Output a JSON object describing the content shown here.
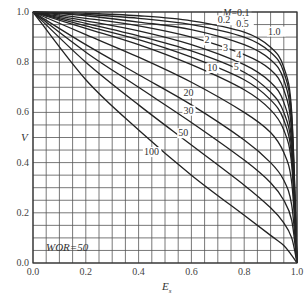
{
  "chart_data": {
    "type": "line",
    "title": "",
    "xlabel": "E_s",
    "ylabel": "V",
    "xlim": [
      0.0,
      1.0
    ],
    "ylim": [
      0.0,
      1.0
    ],
    "grid": true,
    "grid_step": 0.05,
    "x_ticks": [
      "0.0",
      "0.2",
      "0.4",
      "0.6",
      "0.8",
      "1.0"
    ],
    "y_ticks": [
      "0.0",
      "0.2",
      "0.4",
      "0.6",
      "0.8",
      "1.0"
    ],
    "annotation": "WOR=50",
    "legend": "curve labels inline, M = mobility ratio",
    "series": [
      {
        "name": "M=0.1",
        "label": "M=0.1",
        "points": [
          [
            0,
            1
          ],
          [
            0.2,
            0.995
          ],
          [
            0.4,
            0.985
          ],
          [
            0.6,
            0.965
          ],
          [
            0.8,
            0.92
          ],
          [
            0.9,
            0.86
          ],
          [
            0.95,
            0.78
          ],
          [
            0.98,
            0.6
          ],
          [
            1.0,
            0
          ]
        ]
      },
      {
        "name": "0.2",
        "label": "0.2",
        "points": [
          [
            0,
            1
          ],
          [
            0.2,
            0.99
          ],
          [
            0.4,
            0.975
          ],
          [
            0.6,
            0.95
          ],
          [
            0.8,
            0.9
          ],
          [
            0.9,
            0.84
          ],
          [
            0.95,
            0.76
          ],
          [
            0.98,
            0.58
          ],
          [
            1.0,
            0
          ]
        ]
      },
      {
        "name": "0.5",
        "label": "0.5",
        "points": [
          [
            0,
            1
          ],
          [
            0.2,
            0.985
          ],
          [
            0.4,
            0.96
          ],
          [
            0.6,
            0.93
          ],
          [
            0.8,
            0.87
          ],
          [
            0.9,
            0.81
          ],
          [
            0.95,
            0.73
          ],
          [
            0.98,
            0.55
          ],
          [
            1.0,
            0
          ]
        ]
      },
      {
        "name": "1.0",
        "label": "1.0",
        "points": [
          [
            0,
            1
          ],
          [
            0.2,
            0.975
          ],
          [
            0.4,
            0.945
          ],
          [
            0.6,
            0.9
          ],
          [
            0.8,
            0.83
          ],
          [
            0.9,
            0.77
          ],
          [
            0.95,
            0.69
          ],
          [
            0.98,
            0.52
          ],
          [
            1.0,
            0
          ]
        ]
      },
      {
        "name": "2",
        "label": "2",
        "points": [
          [
            0,
            1
          ],
          [
            0.2,
            0.965
          ],
          [
            0.4,
            0.925
          ],
          [
            0.6,
            0.87
          ],
          [
            0.8,
            0.79
          ],
          [
            0.9,
            0.72
          ],
          [
            0.95,
            0.64
          ],
          [
            0.98,
            0.48
          ],
          [
            1.0,
            0
          ]
        ]
      },
      {
        "name": "3",
        "label": "3",
        "points": [
          [
            0,
            1
          ],
          [
            0.2,
            0.955
          ],
          [
            0.4,
            0.905
          ],
          [
            0.6,
            0.845
          ],
          [
            0.8,
            0.76
          ],
          [
            0.9,
            0.68
          ],
          [
            0.95,
            0.6
          ],
          [
            0.98,
            0.45
          ],
          [
            1.0,
            0
          ]
        ]
      },
      {
        "name": "4",
        "label": "4",
        "points": [
          [
            0,
            1
          ],
          [
            0.2,
            0.945
          ],
          [
            0.4,
            0.89
          ],
          [
            0.6,
            0.82
          ],
          [
            0.8,
            0.73
          ],
          [
            0.9,
            0.65
          ],
          [
            0.95,
            0.57
          ],
          [
            0.98,
            0.42
          ],
          [
            1.0,
            0
          ]
        ]
      },
      {
        "name": "5",
        "label": "5",
        "points": [
          [
            0,
            1
          ],
          [
            0.2,
            0.935
          ],
          [
            0.4,
            0.87
          ],
          [
            0.6,
            0.79
          ],
          [
            0.8,
            0.69
          ],
          [
            0.9,
            0.61
          ],
          [
            0.95,
            0.53
          ],
          [
            0.98,
            0.39
          ],
          [
            1.0,
            0
          ]
        ]
      },
      {
        "name": "10",
        "label": "10",
        "points": [
          [
            0,
            1
          ],
          [
            0.2,
            0.91
          ],
          [
            0.4,
            0.82
          ],
          [
            0.6,
            0.72
          ],
          [
            0.8,
            0.6
          ],
          [
            0.9,
            0.52
          ],
          [
            0.95,
            0.44
          ],
          [
            0.98,
            0.32
          ],
          [
            1.0,
            0
          ]
        ]
      },
      {
        "name": "20",
        "label": "20",
        "points": [
          [
            0,
            1
          ],
          [
            0.2,
            0.87
          ],
          [
            0.4,
            0.75
          ],
          [
            0.6,
            0.63
          ],
          [
            0.8,
            0.49
          ],
          [
            0.9,
            0.4
          ],
          [
            0.95,
            0.33
          ],
          [
            0.98,
            0.23
          ],
          [
            1.0,
            0
          ]
        ]
      },
      {
        "name": "30",
        "label": "30",
        "points": [
          [
            0,
            1
          ],
          [
            0.2,
            0.84
          ],
          [
            0.4,
            0.7
          ],
          [
            0.6,
            0.56
          ],
          [
            0.8,
            0.41
          ],
          [
            0.9,
            0.32
          ],
          [
            0.95,
            0.25
          ],
          [
            0.98,
            0.17
          ],
          [
            1.0,
            0
          ]
        ]
      },
      {
        "name": "50",
        "label": "50",
        "points": [
          [
            0,
            1
          ],
          [
            0.2,
            0.8
          ],
          [
            0.4,
            0.63
          ],
          [
            0.6,
            0.47
          ],
          [
            0.8,
            0.31
          ],
          [
            0.9,
            0.22
          ],
          [
            0.95,
            0.16
          ],
          [
            0.98,
            0.1
          ],
          [
            1.0,
            0
          ]
        ]
      },
      {
        "name": "100",
        "label": "100",
        "points": [
          [
            0,
            1
          ],
          [
            0.2,
            0.73
          ],
          [
            0.4,
            0.53
          ],
          [
            0.6,
            0.35
          ],
          [
            0.8,
            0.19
          ],
          [
            0.9,
            0.11
          ],
          [
            0.95,
            0.07
          ],
          [
            0.98,
            0.03
          ],
          [
            1.0,
            0
          ]
        ]
      }
    ],
    "label_positions": [
      {
        "text": "M=0.1",
        "x": 0.72,
        "y": 0.985
      },
      {
        "text": "0.2",
        "x": 0.7,
        "y": 0.955
      },
      {
        "text": "0.5",
        "x": 0.77,
        "y": 0.94
      },
      {
        "text": "1.0",
        "x": 0.89,
        "y": 0.91
      },
      {
        "text": "2",
        "x": 0.65,
        "y": 0.875
      },
      {
        "text": "3",
        "x": 0.72,
        "y": 0.845
      },
      {
        "text": "4",
        "x": 0.77,
        "y": 0.815
      },
      {
        "text": "10",
        "x": 0.66,
        "y": 0.765
      },
      {
        "text": "5",
        "x": 0.76,
        "y": 0.768
      },
      {
        "text": "20",
        "x": 0.57,
        "y": 0.665
      },
      {
        "text": "30",
        "x": 0.57,
        "y": 0.595
      },
      {
        "text": "50",
        "x": 0.55,
        "y": 0.505
      },
      {
        "text": "100",
        "x": 0.42,
        "y": 0.43
      }
    ]
  }
}
